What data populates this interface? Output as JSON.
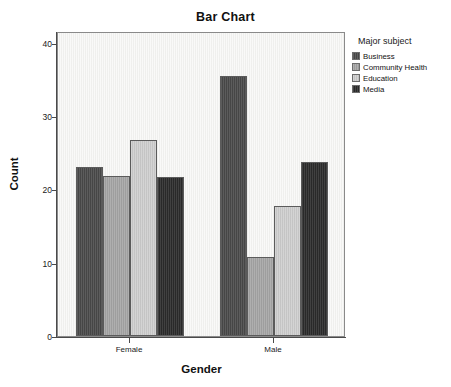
{
  "chart_data": {
    "type": "bar",
    "title": "Bar Chart",
    "xlabel": "Gender",
    "ylabel": "Count",
    "categories": [
      "Female",
      "Male"
    ],
    "series": [
      {
        "name": "Business",
        "color": "#4a4a4a",
        "values": [
          23.0,
          35.5
        ]
      },
      {
        "name": "Community Health",
        "color": "#a6a6a6",
        "values": [
          21.8,
          10.8
        ]
      },
      {
        "name": "Education",
        "color": "#cfcfcf",
        "values": [
          26.7,
          17.7
        ]
      },
      {
        "name": "Media",
        "color": "#2b2b2b",
        "values": [
          21.7,
          23.7
        ]
      }
    ],
    "ylim": [
      0,
      41.6
    ],
    "yticks": [
      0,
      10,
      20,
      30,
      40
    ],
    "ytick_labels": [
      "0",
      "10",
      "20",
      "30",
      "40"
    ],
    "grid": false,
    "legend_position": "right",
    "legend_title": "Major subject",
    "plot_background": "#f2f2f0",
    "axis_color": "#4a4a4a"
  }
}
